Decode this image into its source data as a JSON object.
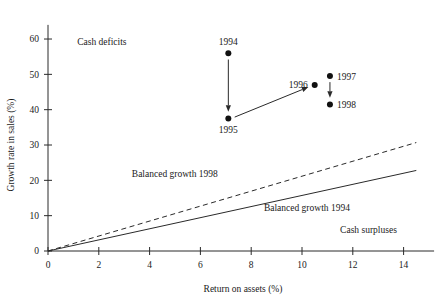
{
  "figure": {
    "top_cut_text": "",
    "background_color": "#ffffff",
    "ink_color": "#1a1a1a"
  },
  "chart_data": {
    "type": "scatter",
    "title": "",
    "xlabel": "Return on assets (%)",
    "ylabel": "Growth rate in sales (%)",
    "xlim": [
      0,
      15.2
    ],
    "ylim": [
      0,
      64
    ],
    "xticks": [
      0,
      2,
      4,
      6,
      8,
      10,
      12,
      14
    ],
    "xtick_labels": [
      "0",
      "2",
      "4",
      "6",
      "8",
      "10",
      "12",
      "14"
    ],
    "yticks": [
      0,
      10,
      20,
      30,
      40,
      50,
      60
    ],
    "ytick_labels": [
      "0",
      "10",
      "20",
      "30",
      "40",
      "50",
      "60"
    ],
    "grid": false,
    "legend": "none",
    "points": [
      {
        "label": "1994",
        "x": 7.1,
        "y": 56.0,
        "label_position": "above"
      },
      {
        "label": "1995",
        "x": 7.1,
        "y": 37.5,
        "label_position": "below"
      },
      {
        "label": "1996",
        "x": 10.5,
        "y": 47.0,
        "label_position": "left"
      },
      {
        "label": "1997",
        "x": 11.1,
        "y": 49.5,
        "label_position": "right"
      },
      {
        "label": "1998",
        "x": 11.1,
        "y": 41.5,
        "label_position": "right"
      }
    ],
    "arrows": [
      {
        "name": "1994-to-1995",
        "from": [
          7.1,
          54.2
        ],
        "to": [
          7.1,
          39.4
        ]
      },
      {
        "name": "1995-to-1996",
        "from": [
          7.35,
          37.9
        ],
        "to": [
          10.25,
          46.4
        ]
      },
      {
        "name": "1997-to-1998",
        "from": [
          11.1,
          47.8
        ],
        "to": [
          11.1,
          43.4
        ]
      }
    ],
    "series": [
      {
        "name": "Balanced growth 1994",
        "style": "solid",
        "slope": 1.57,
        "x": [
          0,
          14.5
        ],
        "values": [
          0,
          22.8
        ]
      },
      {
        "name": "Balanced growth 1998",
        "style": "dashed",
        "slope": 2.12,
        "x": [
          0,
          14.5
        ],
        "values": [
          0,
          30.7
        ]
      }
    ],
    "annotations": [
      {
        "name": "cash-deficits",
        "text": "Cash deficits",
        "x": 1.15,
        "y": 58.2,
        "anchor": "start"
      },
      {
        "name": "balanced-growth-1998",
        "text": "Balanced growth 1998",
        "x": 3.3,
        "y": 20.9,
        "anchor": "start"
      },
      {
        "name": "balanced-growth-1994",
        "text": "Balanced growth 1994",
        "x": 8.5,
        "y": 11.2,
        "anchor": "start"
      },
      {
        "name": "cash-surpluses",
        "text": "Cash surpluses",
        "x": 11.5,
        "y": 5.0,
        "anchor": "start"
      }
    ]
  }
}
